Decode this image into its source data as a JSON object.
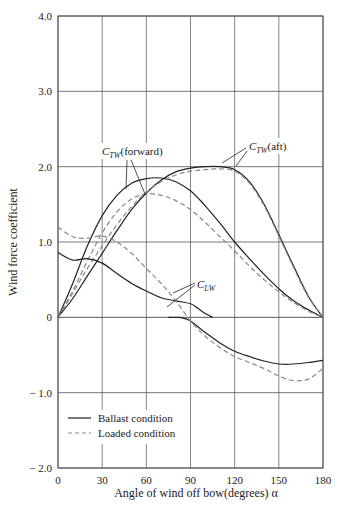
{
  "chart_data": {
    "type": "line",
    "title": "",
    "xlabel": "Angle of wind off bow(degrees) α",
    "ylabel": "Wind force coefficient",
    "xlim": [
      0,
      180
    ],
    "ylim": [
      -2.0,
      4.0
    ],
    "x_ticks": [
      0,
      30,
      60,
      90,
      120,
      150,
      180
    ],
    "x_tick_labels": [
      "0",
      "30",
      "60",
      "90",
      "120",
      "150",
      "180"
    ],
    "y_ticks": [
      -2.0,
      -1.0,
      0,
      1.0,
      2.0,
      3.0,
      4.0
    ],
    "y_tick_labels": [
      "− 2.0",
      "− 1.0",
      "0",
      "1.0",
      "2.0",
      "3.0",
      "4.0"
    ],
    "grid": true,
    "legend": {
      "position": "lower-left",
      "entries": [
        {
          "label": "Ballast condition",
          "style": "solid"
        },
        {
          "label": "Loaded condition",
          "style": "dashed"
        }
      ]
    },
    "annotations": [
      {
        "text": "C_TW(forward)",
        "x": 44,
        "y": 2.25
      },
      {
        "text": "C_TW(aft)",
        "x": 124,
        "y": 2.3
      },
      {
        "text": "C_LW",
        "x": 104,
        "y": 0.5
      }
    ],
    "series": [
      {
        "name": "C_TW(forward) - Ballast",
        "style": "solid",
        "x": [
          0,
          10,
          20,
          30,
          40,
          50,
          60,
          70,
          80,
          90,
          100,
          110,
          120,
          130,
          140,
          150,
          160,
          170,
          180
        ],
        "y": [
          0,
          0.45,
          0.95,
          1.35,
          1.62,
          1.78,
          1.84,
          1.85,
          1.8,
          1.68,
          1.48,
          1.25,
          1.0,
          0.78,
          0.57,
          0.38,
          0.22,
          0.1,
          0
        ]
      },
      {
        "name": "C_TW(forward) - Loaded",
        "style": "dashed",
        "x": [
          0,
          10,
          20,
          30,
          40,
          50,
          60,
          70,
          80,
          90,
          100,
          110,
          120,
          130,
          140,
          150,
          160,
          170,
          180
        ],
        "y": [
          0,
          0.35,
          0.75,
          1.12,
          1.4,
          1.57,
          1.64,
          1.62,
          1.55,
          1.43,
          1.26,
          1.07,
          0.88,
          0.68,
          0.5,
          0.34,
          0.2,
          0.08,
          0
        ]
      },
      {
        "name": "C_TW(aft) - Ballast",
        "style": "solid",
        "x": [
          0,
          10,
          20,
          30,
          40,
          50,
          60,
          70,
          80,
          90,
          100,
          110,
          120,
          130,
          140,
          150,
          160,
          170,
          180
        ],
        "y": [
          0,
          0.25,
          0.55,
          0.85,
          1.15,
          1.43,
          1.65,
          1.82,
          1.93,
          1.98,
          2.0,
          2.0,
          1.96,
          1.8,
          1.5,
          1.1,
          0.68,
          0.28,
          0
        ]
      },
      {
        "name": "C_TW(aft) - Loaded",
        "style": "dashed",
        "x": [
          0,
          10,
          20,
          30,
          40,
          50,
          60,
          70,
          80,
          90,
          100,
          110,
          120,
          130,
          140,
          150,
          160,
          170,
          180
        ],
        "y": [
          0,
          0.32,
          0.65,
          0.95,
          1.23,
          1.47,
          1.66,
          1.8,
          1.89,
          1.94,
          1.96,
          1.97,
          1.94,
          1.78,
          1.48,
          1.08,
          0.66,
          0.27,
          0
        ]
      },
      {
        "name": "C_LW - Ballast (upper)",
        "style": "solid",
        "x": [
          0,
          10,
          20,
          30,
          40,
          50,
          60,
          70,
          80,
          90,
          95,
          100,
          105
        ],
        "y": [
          0.86,
          0.76,
          0.78,
          0.72,
          0.58,
          0.45,
          0.35,
          0.26,
          0.22,
          0.18,
          0.12,
          0.05,
          0
        ]
      },
      {
        "name": "C_LW - Ballast (lower)",
        "style": "solid",
        "x": [
          75,
          80,
          85,
          90,
          100,
          110,
          120,
          130,
          140,
          150,
          160,
          170,
          180
        ],
        "y": [
          0,
          0,
          -0.01,
          -0.05,
          -0.2,
          -0.34,
          -0.45,
          -0.52,
          -0.58,
          -0.62,
          -0.62,
          -0.6,
          -0.57
        ]
      },
      {
        "name": "C_LW - Loaded",
        "style": "dashed",
        "x": [
          0,
          10,
          20,
          30,
          40,
          50,
          60,
          70,
          80,
          90,
          100,
          110,
          120,
          130,
          140,
          150,
          160,
          170,
          180
        ],
        "y": [
          1.2,
          1.07,
          1.05,
          1.08,
          1.0,
          0.85,
          0.65,
          0.45,
          0.22,
          -0.05,
          -0.25,
          -0.4,
          -0.52,
          -0.6,
          -0.68,
          -0.78,
          -0.84,
          -0.82,
          -0.68
        ]
      }
    ]
  }
}
